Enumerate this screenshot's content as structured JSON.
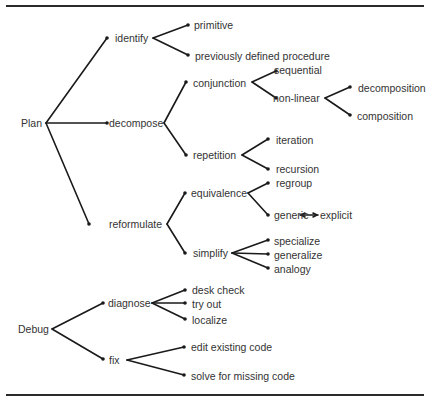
{
  "diagram": {
    "type": "tree",
    "roots": [
      {
        "label": "Plan",
        "children": [
          {
            "label": "identify",
            "children": [
              {
                "label": "primitive"
              },
              {
                "label": "previously defined procedure"
              }
            ]
          },
          {
            "label": "decompose",
            "children": [
              {
                "label": "conjunction",
                "children": [
                  {
                    "label": "sequential"
                  },
                  {
                    "label": "non-linear",
                    "children": [
                      {
                        "label": "decomposition"
                      },
                      {
                        "label": "composition"
                      }
                    ]
                  }
                ]
              },
              {
                "label": "repetition",
                "children": [
                  {
                    "label": "iteration"
                  },
                  {
                    "label": "recursion"
                  }
                ]
              }
            ]
          },
          {
            "label": "reformulate",
            "children": [
              {
                "label": "equivalence",
                "children": [
                  {
                    "label": "regroup"
                  },
                  {
                    "label": "generic",
                    "bidirectional_with": "explicit"
                  }
                ]
              },
              {
                "label": "simplify",
                "children": [
                  {
                    "label": "specialize"
                  },
                  {
                    "label": "generalize"
                  },
                  {
                    "label": "analogy"
                  }
                ]
              }
            ]
          }
        ]
      },
      {
        "label": "Debug",
        "children": [
          {
            "label": "diagnose",
            "children": [
              {
                "label": "desk check"
              },
              {
                "label": "try out"
              },
              {
                "label": "localize"
              }
            ]
          },
          {
            "label": "fix",
            "children": [
              {
                "label": "edit existing code"
              },
              {
                "label": "solve for missing code"
              }
            ]
          }
        ]
      }
    ]
  },
  "labels": {
    "plan": "Plan",
    "identify": "identify",
    "primitive": "primitive",
    "previously_defined": "previously defined procedure",
    "decompose": "decompose",
    "conjunction": "conjunction",
    "sequential": "sequential",
    "non_linear": "non-linear",
    "decomposition": "decomposition",
    "composition": "composition",
    "repetition": "repetition",
    "iteration": "iteration",
    "recursion": "recursion",
    "reformulate": "reformulate",
    "equivalence": "equivalence",
    "regroup": "regroup",
    "generic": "generic",
    "explicit": "explicit",
    "simplify": "simplify",
    "specialize": "specialize",
    "generalize": "generalize",
    "analogy": "analogy",
    "debug": "Debug",
    "diagnose": "diagnose",
    "desk_check": "desk check",
    "try_out": "try out",
    "localize": "localize",
    "fix": "fix",
    "edit_existing": "edit existing code",
    "solve_missing": "solve for missing code"
  }
}
